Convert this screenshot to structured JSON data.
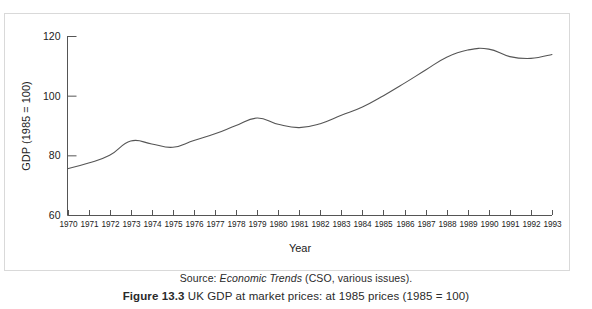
{
  "figure": {
    "source_prefix": "Source: ",
    "source_italic": "Economic Trends",
    "source_suffix": " (CSO, various issues).",
    "caption_label": "Figure 13.3",
    "caption_text": "UK GDP at market prices: at 1985 prices (1985 = 100)"
  },
  "chart_data": {
    "type": "line",
    "title": "",
    "xlabel": "Year",
    "ylabel": "GDP (1985 = 100)",
    "xlim": [
      1970,
      1993
    ],
    "ylim": [
      60,
      120
    ],
    "yticks": [
      60,
      80,
      100,
      120
    ],
    "ytick_labels": [
      "60",
      "80",
      "100",
      "120"
    ],
    "grid": false,
    "legend": "none",
    "line_color": "#555555",
    "categories": [
      "1970",
      "1971",
      "1972",
      "1973",
      "1974",
      "1975",
      "1976",
      "1977",
      "1978",
      "1979",
      "1980",
      "1981",
      "1982",
      "1983",
      "1984",
      "1985",
      "1986",
      "1987",
      "1988",
      "1989",
      "1990",
      "1991",
      "1992",
      "1993"
    ],
    "x": [
      1970,
      1971,
      1972,
      1973,
      1974,
      1975,
      1976,
      1977,
      1978,
      1979,
      1980,
      1981,
      1982,
      1983,
      1984,
      1985,
      1986,
      1987,
      1988,
      1989,
      1990,
      1991,
      1992,
      1993
    ],
    "values": [
      75.5,
      77.4,
      80.0,
      84.8,
      83.8,
      82.7,
      85.0,
      87.2,
      90.0,
      92.5,
      90.4,
      89.3,
      90.6,
      93.4,
      96.2,
      100.0,
      104.2,
      108.6,
      112.9,
      115.3,
      115.6,
      113.1,
      112.5,
      113.8
    ],
    "series": [
      {
        "name": "UK GDP at market prices (1985 = 100)",
        "values": [
          75.5,
          77.4,
          80.0,
          84.8,
          83.8,
          82.7,
          85.0,
          87.2,
          90.0,
          92.5,
          90.4,
          89.3,
          90.6,
          93.4,
          96.2,
          100.0,
          104.2,
          108.6,
          112.9,
          115.3,
          115.6,
          113.1,
          112.5,
          113.8
        ]
      }
    ]
  }
}
